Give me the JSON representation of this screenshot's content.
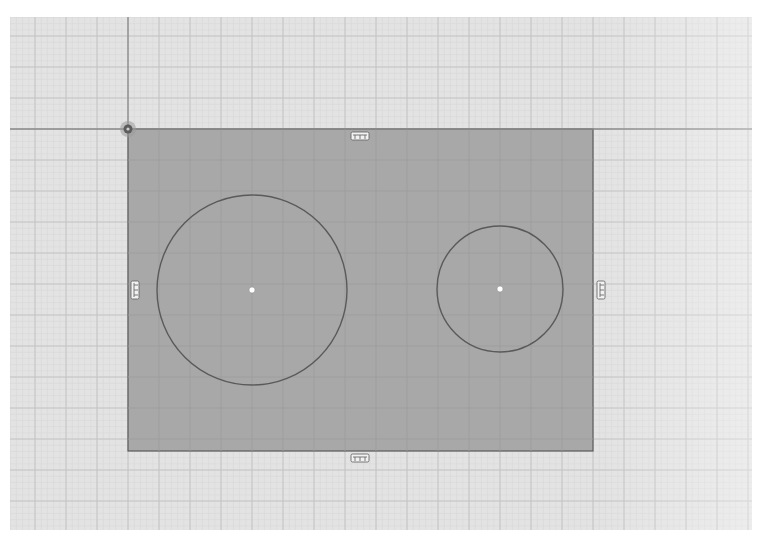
{
  "viewport": {
    "canvas": {
      "x": 10,
      "y": 17,
      "width": 742,
      "height": 513
    },
    "origin": {
      "x": 128,
      "y": 129
    },
    "grid": {
      "minor_spacing": 6.2,
      "major_spacing": 31,
      "minor_color": "#d6d6d6",
      "major_color": "#c4c4c4",
      "background": "#e3e3e3"
    }
  },
  "axes": {
    "horizontal_axis_y": 129,
    "vertical_axis_x": 128,
    "color": "#8a8a8a"
  },
  "origin_marker": {
    "icon": "origin-point-icon",
    "x": 128,
    "y": 129
  },
  "sketch": {
    "profile_fill": "#a8a8a8",
    "stroke": "#5a5a5a",
    "rectangle": {
      "x": 128,
      "y": 129,
      "width": 465,
      "height": 322
    },
    "circles": [
      {
        "name": "large-circle",
        "cx": 252,
        "cy": 290,
        "r": 95,
        "center_point_color": "#ffffff"
      },
      {
        "name": "small-circle",
        "cx": 500,
        "cy": 289,
        "r": 63,
        "center_point_color": "#ffffff"
      }
    ],
    "constraint_glyphs": [
      {
        "name": "top-edge-horizontal-constraint",
        "icon": "horizontal-constraint-icon",
        "x": 360,
        "y": 136,
        "orientation": "horizontal"
      },
      {
        "name": "bottom-edge-horizontal-constraint",
        "icon": "horizontal-constraint-icon",
        "x": 360,
        "y": 458,
        "orientation": "horizontal"
      },
      {
        "name": "left-edge-vertical-constraint",
        "icon": "vertical-constraint-icon",
        "x": 135,
        "y": 290,
        "orientation": "vertical"
      },
      {
        "name": "right-edge-vertical-constraint",
        "icon": "vertical-constraint-icon",
        "x": 601,
        "y": 290,
        "orientation": "vertical"
      }
    ]
  }
}
